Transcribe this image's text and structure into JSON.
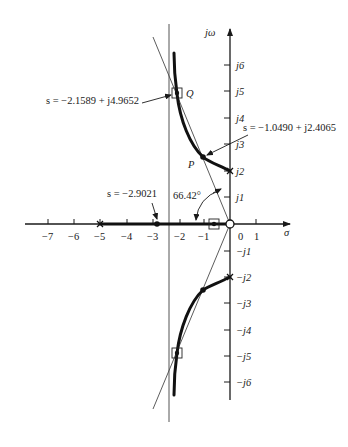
{
  "figure": {
    "type": "root-locus",
    "axes": {
      "x_label": "σ",
      "y_label": "jω",
      "x_ticks": [
        {
          "value": -7,
          "label": "−7"
        },
        {
          "value": -6,
          "label": "−6"
        },
        {
          "value": -5,
          "label": "−5"
        },
        {
          "value": -4,
          "label": "−4"
        },
        {
          "value": -3,
          "label": "−3"
        },
        {
          "value": -2,
          "label": "−2"
        },
        {
          "value": -1,
          "label": "−1"
        },
        {
          "value": 0,
          "label": "0"
        },
        {
          "value": 1,
          "label": "1"
        }
      ],
      "y_ticks": [
        {
          "value": 6,
          "label": "j6"
        },
        {
          "value": 5,
          "label": "j5"
        },
        {
          "value": 4,
          "label": "j4"
        },
        {
          "value": 3,
          "label": "j3"
        },
        {
          "value": 2,
          "label": "j2"
        },
        {
          "value": 1,
          "label": "j1"
        },
        {
          "value": -1,
          "label": "−j1"
        },
        {
          "value": -2,
          "label": "−j2"
        },
        {
          "value": -3,
          "label": "−j3"
        },
        {
          "value": -4,
          "label": "−j4"
        },
        {
          "value": -5,
          "label": "−j5"
        },
        {
          "value": -6,
          "label": "−j6"
        }
      ]
    },
    "poles": [
      {
        "re": -5,
        "im": 0
      },
      {
        "re": 0,
        "im": 2
      },
      {
        "re": 0,
        "im": -2
      }
    ],
    "open_circle": {
      "re": 0,
      "im": 0
    },
    "zero_box": {
      "re": -0.6,
      "im": 0
    },
    "points": {
      "P": {
        "label": "P",
        "re": -1.049,
        "im": 2.4065,
        "annotation": "s = −1.0490 + j2.4065"
      },
      "Q": {
        "label": "Q",
        "re": -2.1589,
        "im": 4.9652,
        "annotation": "s = −2.1589 + j4.9652"
      },
      "breakaway": {
        "re": -2.9021,
        "im": 0,
        "annotation": "s = −2.9021"
      }
    },
    "angle_label": "66.42°",
    "vertical_line_sigma": -2.3
  }
}
